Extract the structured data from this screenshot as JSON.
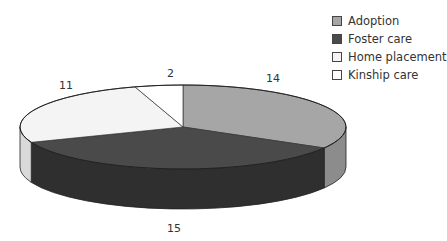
{
  "chart_data": {
    "type": "pie",
    "style": "3d",
    "title": "",
    "categories": [
      "Adoption",
      "Foster care",
      "Home placement",
      "Kinship care"
    ],
    "values": [
      14,
      15,
      11,
      2
    ],
    "colors": [
      "#a6a6a6",
      "#4a4a4a",
      "#f4f4f4",
      "#ffffff"
    ],
    "side_colors": [
      "#8c8c8c",
      "#2f2f2f",
      "#d9d9d9",
      "#e6e6e6"
    ],
    "data_labels": [
      "14",
      "15",
      "11",
      "2"
    ],
    "legend_position": "top-right"
  },
  "legend": [
    {
      "label": "Adoption",
      "color": "#a6a6a6"
    },
    {
      "label": "Foster care",
      "color": "#4a4a4a"
    },
    {
      "label": "Home placement",
      "color": "#f4f4f4"
    },
    {
      "label": "Kinship care",
      "color": "#ffffff"
    }
  ],
  "labels": {
    "adoption": "14",
    "foster": "15",
    "home": "11",
    "kinship": "2"
  }
}
